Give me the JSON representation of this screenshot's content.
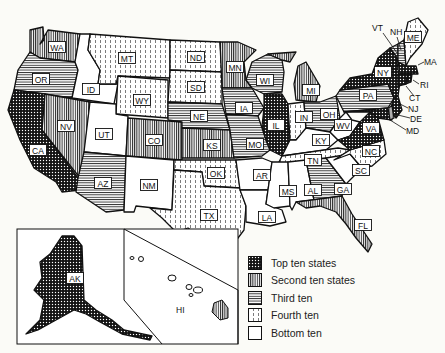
{
  "map": {
    "states": [
      {
        "abbr": "WA",
        "tier": "second"
      },
      {
        "abbr": "OR",
        "tier": "third"
      },
      {
        "abbr": "CA",
        "tier": "top"
      },
      {
        "abbr": "ID",
        "tier": "bottom"
      },
      {
        "abbr": "NV",
        "tier": "second"
      },
      {
        "abbr": "MT",
        "tier": "fourth"
      },
      {
        "abbr": "WY",
        "tier": "fourth"
      },
      {
        "abbr": "UT",
        "tier": "bottom"
      },
      {
        "abbr": "AZ",
        "tier": "third"
      },
      {
        "abbr": "CO",
        "tier": "second"
      },
      {
        "abbr": "NM",
        "tier": "bottom"
      },
      {
        "abbr": "ND",
        "tier": "fourth"
      },
      {
        "abbr": "SD",
        "tier": "fourth"
      },
      {
        "abbr": "NE",
        "tier": "third"
      },
      {
        "abbr": "KS",
        "tier": "second"
      },
      {
        "abbr": "OK",
        "tier": "fourth"
      },
      {
        "abbr": "TX",
        "tier": "fourth"
      },
      {
        "abbr": "MN",
        "tier": "second"
      },
      {
        "abbr": "IA",
        "tier": "third"
      },
      {
        "abbr": "MO",
        "tier": "third"
      },
      {
        "abbr": "AR",
        "tier": "bottom"
      },
      {
        "abbr": "LA",
        "tier": "bottom"
      },
      {
        "abbr": "WI",
        "tier": "third"
      },
      {
        "abbr": "IL",
        "tier": "top"
      },
      {
        "abbr": "MS",
        "tier": "bottom"
      },
      {
        "abbr": "MI",
        "tier": "second"
      },
      {
        "abbr": "IN",
        "tier": "fourth"
      },
      {
        "abbr": "KY",
        "tier": "bottom"
      },
      {
        "abbr": "TN",
        "tier": "fourth"
      },
      {
        "abbr": "AL",
        "tier": "bottom"
      },
      {
        "abbr": "OH",
        "tier": "third"
      },
      {
        "abbr": "WV",
        "tier": "bottom"
      },
      {
        "abbr": "GA",
        "tier": "third"
      },
      {
        "abbr": "FL",
        "tier": "second"
      },
      {
        "abbr": "SC",
        "tier": "bottom"
      },
      {
        "abbr": "NC",
        "tier": "fourth"
      },
      {
        "abbr": "VA",
        "tier": "top"
      },
      {
        "abbr": "PA",
        "tier": "third"
      },
      {
        "abbr": "NY",
        "tier": "top"
      },
      {
        "abbr": "ME",
        "tier": "fourth"
      },
      {
        "abbr": "VT",
        "tier": "third"
      },
      {
        "abbr": "NH",
        "tier": "third"
      },
      {
        "abbr": "MA",
        "tier": "top"
      },
      {
        "abbr": "RI",
        "tier": "top"
      },
      {
        "abbr": "CT",
        "tier": "top"
      },
      {
        "abbr": "NJ",
        "tier": "top"
      },
      {
        "abbr": "DE",
        "tier": "second"
      },
      {
        "abbr": "MD",
        "tier": "top"
      },
      {
        "abbr": "AK",
        "tier": "top"
      },
      {
        "abbr": "HI",
        "tier": "second"
      }
    ],
    "labels": {
      "WA": "WA",
      "OR": "OR",
      "CA": "CA",
      "ID": "ID",
      "NV": "NV",
      "MT": "MT",
      "WY": "WY",
      "UT": "UT",
      "AZ": "AZ",
      "CO": "CO",
      "NM": "NM",
      "ND": "ND",
      "SD": "SD",
      "NE": "NE",
      "KS": "KS",
      "OK": "OK",
      "TX": "TX",
      "MN": "MN",
      "IA": "IA",
      "MO": "MO",
      "AR": "AR",
      "LA": "LA",
      "WI": "WI",
      "IL": "IL",
      "MS": "MS",
      "MI": "MI",
      "IN": "IN",
      "KY": "KY",
      "TN": "TN",
      "AL": "AL",
      "OH": "OH",
      "WV": "WV",
      "GA": "GA",
      "FL": "FL",
      "SC": "SC",
      "NC": "NC",
      "VA": "VA",
      "PA": "PA",
      "NY": "NY",
      "ME": "ME",
      "VT": "VT",
      "NH": "NH",
      "MA": "MA",
      "RI": "RI",
      "CT": "CT",
      "NJ": "NJ",
      "DE": "DE",
      "MD": "MD",
      "AK": "AK",
      "HI": "HI"
    }
  },
  "legend": {
    "items": [
      {
        "label": "Top ten states",
        "pattern": "crosshatch-dark"
      },
      {
        "label": "Second ten states",
        "pattern": "dense-vertical"
      },
      {
        "label": "Third ten",
        "pattern": "horizontal"
      },
      {
        "label": "Fourth ten",
        "pattern": "dashed-vertical"
      },
      {
        "label": "Bottom ten",
        "pattern": "blank"
      }
    ]
  },
  "colors": {
    "ink": "#111111",
    "paper": "#fbfbf7"
  }
}
